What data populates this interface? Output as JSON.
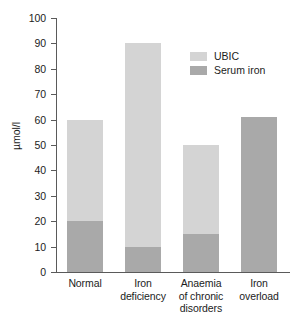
{
  "chart_data": {
    "type": "bar",
    "stacked": true,
    "title": "",
    "xlabel": "",
    "ylabel": "µmol/l",
    "ylim": [
      0,
      100
    ],
    "yticks": [
      0,
      10,
      20,
      30,
      40,
      50,
      60,
      70,
      80,
      90,
      100
    ],
    "ytick_labels": [
      "0",
      "10",
      "20",
      "30",
      "40",
      "50",
      "60",
      "70",
      "80",
      "90",
      "100"
    ],
    "grid": false,
    "legend_position": "upper right",
    "categories": [
      "Normal",
      "Iron deficiency",
      "Anaemia of chronic disorders",
      "Iron overload"
    ],
    "category_lines": [
      [
        "Normal"
      ],
      [
        "Iron",
        "deficiency"
      ],
      [
        "Anaemia",
        "of chronic",
        "disorders"
      ],
      [
        "Iron",
        "overload"
      ]
    ],
    "series": [
      {
        "name": "Serum iron",
        "color": "#a9a9a9",
        "values": [
          20,
          10,
          15,
          61
        ]
      },
      {
        "name": "UBIC",
        "color": "#d4d4d4",
        "values": [
          40,
          80,
          35,
          0
        ]
      }
    ],
    "totals": [
      60,
      90,
      50,
      61
    ],
    "legend_entries": [
      {
        "label": "UBIC",
        "color": "#d4d4d4"
      },
      {
        "label": "Serum iron",
        "color": "#a9a9a9"
      }
    ],
    "axis_color": "#5a5a5a",
    "text_color": "#1c1c1c",
    "background": "#ffffff"
  }
}
